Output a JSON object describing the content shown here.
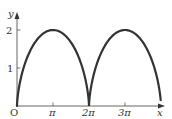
{
  "chart_data": {
    "type": "line",
    "title": "",
    "xlabel": "x",
    "ylabel": "y",
    "origin_label": "O",
    "x_ticks": [
      {
        "value": 3.14159,
        "label": "π"
      },
      {
        "value": 6.28319,
        "label": "2π"
      },
      {
        "value": 9.42478,
        "label": "3π"
      }
    ],
    "y_ticks": [
      {
        "value": 1,
        "label": "1"
      },
      {
        "value": 2,
        "label": "2"
      }
    ],
    "xlim": [
      0,
      12.6
    ],
    "ylim": [
      0,
      2.3
    ],
    "grid": false,
    "legend": null,
    "series": [
      {
        "name": "cycloid",
        "equation": "x = t - sin t, y = 1 - cos t",
        "t_range": [
          0,
          12.0
        ],
        "color": "#333333",
        "x": [
          0,
          0.0207,
          0.1585,
          0.5,
          1.0708,
          1.8589,
          2.7225,
          3.1416,
          3.5607,
          4.4243,
          5.2124,
          5.7832,
          6.1247,
          6.2625,
          6.2832,
          6.3039,
          6.4417,
          6.7832,
          7.354,
          8.1421,
          9.0057,
          9.4248,
          9.8439,
          10.7075,
          11.4956,
          12.0664,
          12.4
        ],
        "y": [
          0,
          0.1224,
          0.4597,
          0.8586,
          1.3827,
          1.7071,
          1.9659,
          2.0,
          1.9659,
          1.7071,
          1.3827,
          0.8586,
          0.4597,
          0.1224,
          0,
          0.1224,
          0.4597,
          0.8586,
          1.3827,
          1.7071,
          1.9659,
          2.0,
          1.9659,
          1.7071,
          1.3827,
          0.8586,
          0.34
        ]
      }
    ]
  },
  "labels": {
    "x_axis": "x",
    "y_axis": "y",
    "origin": "O",
    "tick_pi": "π",
    "tick_2pi": "2π",
    "tick_3pi": "3π",
    "tick_1": "1",
    "tick_2": "2"
  }
}
